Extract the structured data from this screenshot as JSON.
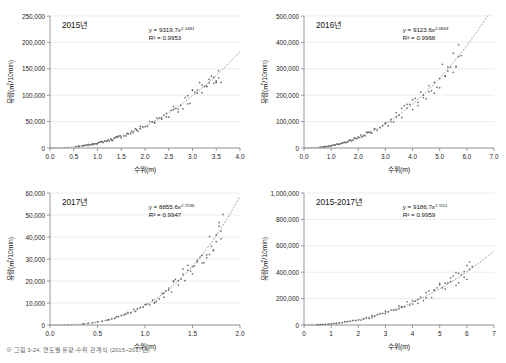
{
  "caption": "※ 그림 3-24. 연도별 유량-수위 관계식 (2015~2017년)",
  "charts": [
    {
      "id": "chart-2015",
      "title": "2015년",
      "type": "scatter",
      "equation": "y = 9319.7x",
      "equation_exp": "2.1481",
      "r2": "R² = 0.9953",
      "xlabel": "수위(m)",
      "ylabel": "유량(㎥/10min)",
      "xlim": [
        0.0,
        4.0
      ],
      "xticks": [
        "0.0",
        "0.5",
        "1.0",
        "1.5",
        "2.0",
        "2.5",
        "3.0",
        "3.5",
        "4.0"
      ],
      "ylim": [
        0,
        250000
      ],
      "yticks": [
        "0",
        "50,000",
        "100,000",
        "150,000",
        "200,000",
        "250,000"
      ],
      "coef": 9319.7,
      "exp": 2.1481,
      "points_x": [
        0.55,
        0.6,
        0.62,
        0.68,
        0.7,
        0.72,
        0.75,
        0.78,
        0.8,
        0.82,
        0.85,
        0.88,
        0.9,
        0.92,
        0.95,
        0.98,
        1.0,
        1.02,
        1.05,
        1.08,
        1.1,
        1.12,
        1.15,
        1.18,
        1.2,
        1.22,
        1.25,
        1.28,
        1.3,
        1.32,
        1.35,
        1.38,
        1.4,
        1.42,
        1.45,
        1.48,
        1.5,
        1.55,
        1.6,
        1.62,
        1.65,
        1.7,
        1.72,
        1.75,
        1.8,
        1.82,
        1.85,
        1.9,
        1.95,
        2.0,
        2.05,
        2.1,
        2.15,
        2.2,
        2.25,
        2.3,
        2.35,
        2.4,
        2.45,
        2.5,
        2.55,
        2.6,
        2.65,
        2.7,
        2.75,
        2.8,
        2.85,
        2.9,
        2.95,
        3.0,
        3.05,
        3.1,
        3.15,
        3.2,
        3.25,
        3.3,
        3.35,
        3.4,
        3.45,
        3.5,
        3.55,
        3.6,
        2.35,
        2.6,
        2.9,
        3.1,
        3.3,
        3.45,
        3.5,
        3.55,
        1.9,
        2.2,
        2.45,
        2.7,
        3.0,
        3.2,
        3.35,
        3.5
      ]
    },
    {
      "id": "chart-2016",
      "title": "2016년",
      "type": "scatter",
      "equation": "y = 9123.6x",
      "equation_exp": "2.0944",
      "r2": "R² = 0.9968",
      "xlabel": "수위(m)",
      "ylabel": "유량(㎥/10min)",
      "xlim": [
        0.0,
        7.0
      ],
      "xticks": [
        "0.0",
        "1.0",
        "2.0",
        "3.0",
        "4.0",
        "5.0",
        "6.0",
        "7.0"
      ],
      "ylim": [
        0,
        500000
      ],
      "yticks": [
        "0",
        "100,000",
        "200,000",
        "300,000",
        "400,000",
        "500,000"
      ],
      "coef": 9123.6,
      "exp": 2.0944,
      "points_x": [
        0.6,
        0.7,
        0.75,
        0.8,
        0.85,
        0.9,
        0.95,
        1.0,
        1.05,
        1.1,
        1.15,
        1.2,
        1.25,
        1.3,
        1.35,
        1.4,
        1.45,
        1.5,
        1.55,
        1.6,
        1.65,
        1.7,
        1.75,
        1.8,
        1.85,
        1.9,
        1.95,
        2.0,
        2.05,
        2.1,
        2.15,
        2.2,
        2.25,
        2.3,
        2.35,
        2.4,
        2.45,
        2.5,
        2.6,
        2.7,
        2.8,
        2.9,
        3.0,
        3.1,
        3.2,
        3.3,
        3.4,
        3.5,
        3.6,
        3.7,
        3.8,
        3.9,
        4.0,
        4.1,
        4.2,
        4.3,
        4.4,
        4.5,
        4.6,
        4.7,
        4.8,
        4.9,
        5.0,
        5.1,
        5.2,
        5.3,
        5.4,
        5.5,
        5.6,
        5.7,
        5.8,
        3.2,
        3.6,
        4.0,
        4.4,
        4.8,
        5.2,
        5.5,
        5.7,
        2.6,
        3.0,
        3.4,
        3.8,
        4.2,
        4.6,
        5.0,
        5.3,
        5.6
      ]
    },
    {
      "id": "chart-2017",
      "title": "2017년",
      "type": "scatter",
      "equation": "y = 8855.6x",
      "equation_exp": "2.7236",
      "r2": "R² = 0.9947",
      "xlabel": "수위(m)",
      "ylabel": "유량(㎥/10min)",
      "xlim": [
        0.0,
        2.0
      ],
      "xticks": [
        "0.0",
        "0.5",
        "1.0",
        "1.5",
        "2.0"
      ],
      "ylim": [
        0,
        60000
      ],
      "yticks": [
        "0",
        "10,000",
        "20,000",
        "30,000",
        "40,000",
        "50,000",
        "60,000"
      ],
      "coef": 8855.6,
      "exp": 2.7236,
      "points_x": [
        0.35,
        0.4,
        0.45,
        0.5,
        0.55,
        0.6,
        0.62,
        0.65,
        0.68,
        0.7,
        0.72,
        0.75,
        0.78,
        0.8,
        0.82,
        0.85,
        0.88,
        0.9,
        0.92,
        0.95,
        0.98,
        1.0,
        1.02,
        1.05,
        1.08,
        1.1,
        1.12,
        1.15,
        1.18,
        1.2,
        1.22,
        1.25,
        1.28,
        1.3,
        1.32,
        1.35,
        1.38,
        1.4,
        1.42,
        1.45,
        1.48,
        1.5,
        1.52,
        1.55,
        1.58,
        1.6,
        1.62,
        1.65,
        1.68,
        1.7,
        1.72,
        1.75,
        1.78,
        1.8,
        1.82,
        1.25,
        1.35,
        1.45,
        1.55,
        1.65,
        1.72,
        1.78,
        1.8,
        1.1,
        1.2,
        1.3,
        1.4,
        1.5,
        1.6,
        1.68,
        1.75
      ]
    },
    {
      "id": "chart-2015-2017",
      "title": "2015-2017년",
      "type": "scatter",
      "equation": "y = 9186.7x",
      "equation_exp": "2.1111",
      "r2": "R² = 0.9959",
      "xlabel": "수위(m)",
      "ylabel": "유량(㎥/10min)",
      "xlim": [
        0,
        7
      ],
      "xticks": [
        "0",
        "1",
        "2",
        "3",
        "4",
        "5",
        "6",
        "7"
      ],
      "ylim": [
        0,
        1000000
      ],
      "yticks": [
        "0",
        "200,000",
        "400,000",
        "600,000",
        "800,000",
        "1,000,000"
      ],
      "coef": 9186.7,
      "exp": 2.1111,
      "points_x": [
        0.5,
        0.6,
        0.7,
        0.8,
        0.9,
        1.0,
        1.1,
        1.2,
        1.3,
        1.4,
        1.5,
        1.6,
        1.7,
        1.8,
        1.9,
        2.0,
        2.1,
        2.2,
        2.3,
        2.4,
        2.5,
        2.6,
        2.7,
        2.8,
        2.9,
        3.0,
        3.1,
        3.2,
        3.3,
        3.4,
        3.5,
        3.6,
        3.7,
        3.8,
        3.9,
        4.0,
        4.1,
        4.2,
        4.3,
        4.4,
        4.5,
        4.6,
        4.7,
        4.8,
        4.9,
        5.0,
        5.1,
        5.2,
        5.3,
        5.4,
        5.5,
        5.6,
        5.7,
        5.8,
        5.9,
        6.0,
        6.1,
        6.2,
        3.5,
        4.0,
        4.5,
        5.0,
        5.4,
        5.7,
        5.9,
        6.1,
        2.5,
        3.0,
        3.6,
        4.2,
        4.8,
        5.2,
        5.6,
        6.0
      ]
    }
  ],
  "colors": {
    "point": "#555555",
    "trend": "#7a7a7a",
    "axis": "#808080",
    "text": "#1a1a1a",
    "background": "#ffffff"
  }
}
